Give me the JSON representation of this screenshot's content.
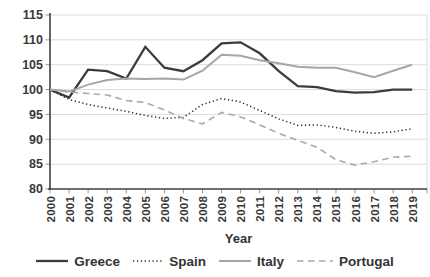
{
  "chart_data": {
    "type": "line",
    "title": "",
    "xlabel": "Year",
    "ylabel": "",
    "ylim": [
      80,
      115
    ],
    "yticks": [
      115,
      110,
      105,
      100,
      95,
      90,
      85,
      80
    ],
    "grid": "horizontal",
    "legend_position": "bottom",
    "x_categories": [
      "2000",
      "2001",
      "2002",
      "2003",
      "2004",
      "2005",
      "2006",
      "2007",
      "2008",
      "2009",
      "2010",
      "2011",
      "2012",
      "2013",
      "2014",
      "2015",
      "2016",
      "2017",
      "2018",
      "2019"
    ],
    "series": [
      {
        "name": "Greece",
        "color": "#3c3c3c",
        "dash": "solid",
        "stroke_width": 2.3,
        "values": [
          100,
          98.4,
          104.0,
          103.7,
          102.2,
          108.6,
          104.4,
          103.7,
          105.9,
          109.3,
          109.5,
          107.3,
          103.7,
          100.7,
          100.5,
          99.7,
          99.4,
          99.5,
          100.0,
          100.0
        ]
      },
      {
        "name": "Spain",
        "color": "#2f2f2f",
        "dash": "dotted",
        "stroke_width": 1.5,
        "values": [
          100,
          98.0,
          97.0,
          96.3,
          95.6,
          94.8,
          94.2,
          94.4,
          97.0,
          98.2,
          97.5,
          95.8,
          94.1,
          92.8,
          92.9,
          92.4,
          91.6,
          91.2,
          91.5,
          92.1
        ]
      },
      {
        "name": "Italy",
        "color": "#a6a6a6",
        "dash": "solid",
        "stroke_width": 2.0,
        "values": [
          100,
          99.6,
          101.0,
          101.9,
          102.2,
          102.1,
          102.2,
          102.0,
          103.8,
          107.0,
          106.8,
          105.9,
          105.3,
          104.6,
          104.4,
          104.4,
          103.5,
          102.5,
          103.8,
          105.0
        ]
      },
      {
        "name": "Portugal",
        "color": "#a9a9a9",
        "dash": "dashed",
        "stroke_width": 1.6,
        "values": [
          100,
          99.5,
          99.2,
          98.9,
          97.8,
          97.4,
          95.9,
          94.2,
          93.1,
          95.4,
          94.5,
          92.9,
          91.2,
          89.8,
          88.4,
          85.9,
          84.8,
          85.5,
          86.4,
          86.6
        ]
      }
    ]
  },
  "colors": {
    "background": "#ffffff",
    "axis": "#3f3f3f",
    "gridline": "#dcdcdc",
    "tick_mark": "#9a9a9a",
    "label_text": "#383838"
  }
}
